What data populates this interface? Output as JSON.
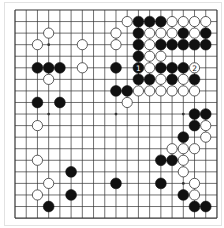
{
  "board": {
    "size": 19,
    "origin_x": 15,
    "origin_y": 10,
    "spacing_x": 11.22,
    "spacing_y": 11.56,
    "stone_radius": 5.4,
    "colors": {
      "line": "#333333",
      "black": "#111111",
      "white": "#ffffff",
      "white_edge": "#333333",
      "background": "#ffffff"
    },
    "star_points": [
      [
        3,
        3
      ],
      [
        9,
        3
      ],
      [
        15,
        3
      ],
      [
        3,
        9
      ],
      [
        9,
        9
      ],
      [
        15,
        9
      ],
      [
        3,
        15
      ],
      [
        9,
        15
      ],
      [
        15,
        15
      ]
    ],
    "black_stones": [
      [
        2,
        5
      ],
      [
        3,
        5
      ],
      [
        4,
        5
      ],
      [
        2,
        8
      ],
      [
        4,
        8
      ],
      [
        11,
        1
      ],
      [
        12,
        1
      ],
      [
        13,
        1
      ],
      [
        11,
        2
      ],
      [
        15,
        2
      ],
      [
        17,
        2
      ],
      [
        11,
        3
      ],
      [
        13,
        3
      ],
      [
        14,
        3
      ],
      [
        15,
        3
      ],
      [
        16,
        3
      ],
      [
        17,
        3
      ],
      [
        11,
        4
      ],
      [
        9,
        5
      ],
      [
        11,
        5
      ],
      [
        13,
        5
      ],
      [
        14,
        5
      ],
      [
        15,
        5
      ],
      [
        11,
        6
      ],
      [
        12,
        6
      ],
      [
        14,
        6
      ],
      [
        16,
        6
      ],
      [
        9,
        7
      ],
      [
        10,
        7
      ],
      [
        16,
        9
      ],
      [
        17,
        9
      ],
      [
        16,
        10
      ],
      [
        15,
        11
      ],
      [
        13,
        13
      ],
      [
        14,
        13
      ],
      [
        13,
        15
      ],
      [
        15,
        16
      ],
      [
        16,
        17
      ],
      [
        17,
        17
      ],
      [
        5,
        14
      ],
      [
        9,
        15
      ],
      [
        5,
        16
      ],
      [
        3,
        17
      ]
    ],
    "white_stones": [
      [
        3,
        2
      ],
      [
        2,
        3
      ],
      [
        6,
        3
      ],
      [
        6,
        5
      ],
      [
        3,
        6
      ],
      [
        2,
        10
      ],
      [
        2,
        13
      ],
      [
        3,
        15
      ],
      [
        2,
        16
      ],
      [
        10,
        1
      ],
      [
        14,
        1
      ],
      [
        15,
        1
      ],
      [
        16,
        1
      ],
      [
        17,
        1
      ],
      [
        9,
        2
      ],
      [
        12,
        2
      ],
      [
        13,
        2
      ],
      [
        14,
        2
      ],
      [
        16,
        2
      ],
      [
        9,
        3
      ],
      [
        12,
        3
      ],
      [
        12,
        4
      ],
      [
        13,
        4
      ],
      [
        12,
        5
      ],
      [
        16,
        5
      ],
      [
        13,
        6
      ],
      [
        15,
        6
      ],
      [
        11,
        7
      ],
      [
        12,
        7
      ],
      [
        13,
        7
      ],
      [
        14,
        7
      ],
      [
        15,
        7
      ],
      [
        16,
        7
      ],
      [
        10,
        8
      ],
      [
        17,
        10
      ],
      [
        17,
        11
      ],
      [
        14,
        12
      ],
      [
        15,
        12
      ],
      [
        16,
        12
      ],
      [
        15,
        13
      ],
      [
        15,
        14
      ],
      [
        16,
        15
      ],
      [
        16,
        16
      ]
    ],
    "labels": [
      {
        "col": 11,
        "row": 5,
        "text": "1",
        "on": "black"
      },
      {
        "col": 16,
        "row": 5,
        "text": "2",
        "on": "white"
      }
    ]
  }
}
